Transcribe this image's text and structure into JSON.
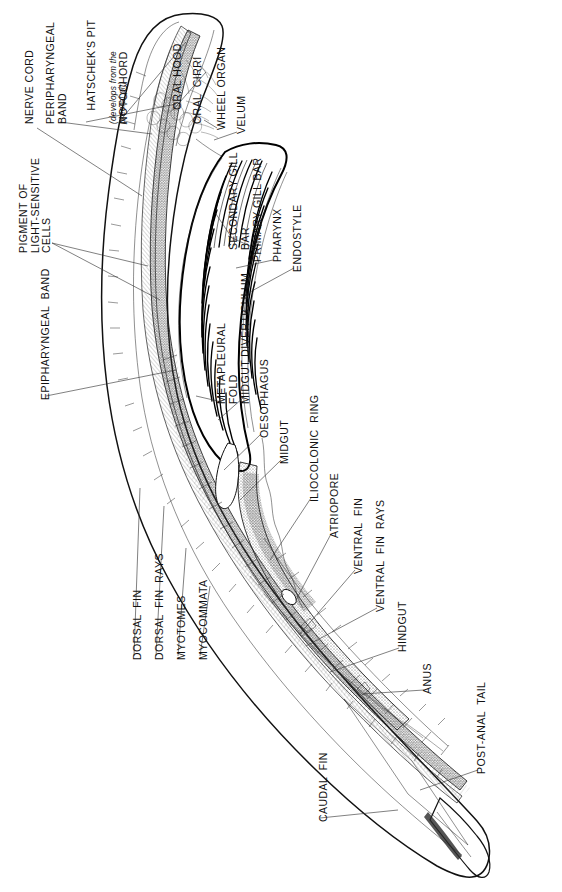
{
  "figure": {
    "orientation": "labels-rotated-90-ccw",
    "background_color": "#ffffff",
    "ink_color": "#111111"
  },
  "labels": [
    {
      "id": "nerve-cord",
      "text": "NERVE CORD"
    },
    {
      "id": "peripharyngeal-band",
      "text": "PERIPHARYNGEAL\nBAND"
    },
    {
      "id": "hatscheks-pit",
      "text": "HATSCHEK'S PIT",
      "note": "(develops from the\npreoral pit)"
    },
    {
      "id": "notochord",
      "text": "NOTOCHORD"
    },
    {
      "id": "oral-hood",
      "text": "ORAL HOOD"
    },
    {
      "id": "oral-cirri",
      "text": "ORAL  CIRRI"
    },
    {
      "id": "wheel-organ",
      "text": "WHEEL ORGAN"
    },
    {
      "id": "velum",
      "text": "VELUM"
    },
    {
      "id": "pigment-of-light-sensitive-cells",
      "text": "PIGMENT OF\nLIGHT-SENSITIVE\nCELLS"
    },
    {
      "id": "secondary-gill-bar",
      "text": "SECONDARY GILL\nBAR"
    },
    {
      "id": "primary-gill-bar",
      "text": "PRIMARY GILL BAR"
    },
    {
      "id": "pharynx",
      "text": "PHARYNX"
    },
    {
      "id": "endostyle",
      "text": "ENDOSTYLE"
    },
    {
      "id": "epipharyngeal-band",
      "text": "EPIPHARYNGEAL  BAND"
    },
    {
      "id": "metapleural-fold",
      "text": "METAPLEURAL\nFOLD"
    },
    {
      "id": "midgut-diverticulum",
      "text": "MIDGUT DIVERTICULUM"
    },
    {
      "id": "oesophagus",
      "text": "OESOPHAGUS"
    },
    {
      "id": "midgut",
      "text": "MIDGUT"
    },
    {
      "id": "iliocolonic-ring",
      "text": "ILIOCOLONIC  RING"
    },
    {
      "id": "atriopore",
      "text": "ATRIOPORE"
    },
    {
      "id": "ventral-fin",
      "text": "VENTRAL  FIN"
    },
    {
      "id": "ventral-fin-rays",
      "text": "VENTRAL  FIN  RAYS"
    },
    {
      "id": "hindgut",
      "text": "HINDGUT"
    },
    {
      "id": "anus",
      "text": "ANUS"
    },
    {
      "id": "post-anal-tail",
      "text": "POST-ANAL  TAIL"
    },
    {
      "id": "dorsal-fin",
      "text": "DORSAL  FIN"
    },
    {
      "id": "dorsal-fin-rays",
      "text": "DORSAL  FIN  RAYS"
    },
    {
      "id": "myotomes",
      "text": "MYOTOMES"
    },
    {
      "id": "myocommata",
      "text": "MYOCOMMATA"
    },
    {
      "id": "caudal-fin",
      "text": "CAUDAL  FIN"
    }
  ]
}
